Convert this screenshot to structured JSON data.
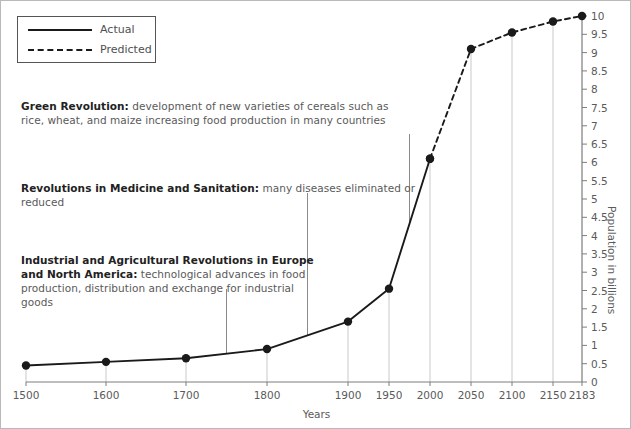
{
  "chart_data": {
    "type": "line",
    "title": "",
    "xlabel": "Years",
    "ylabel": "Population in billions",
    "ylim": [
      0,
      10
    ],
    "ytick_step": 0.5,
    "yticks": [
      "0",
      "0.5",
      "1",
      "1.5",
      "2",
      "2.5",
      "3",
      "3.5",
      "4",
      "4.5",
      "5",
      "5.5",
      "6",
      "6.5",
      "7",
      "7.5",
      "8",
      "8.5",
      "9",
      "9.5",
      "10"
    ],
    "xticks": [
      "1500",
      "1600",
      "1700",
      "1800",
      "1900",
      "1950",
      "2000",
      "2050",
      "2100",
      "2150",
      "2183"
    ],
    "grid": false,
    "legend_position": "top-left",
    "series": [
      {
        "name": "Actual",
        "style": "solid",
        "x": [
          1500,
          1600,
          1700,
          1800,
          1900,
          1950,
          2000
        ],
        "values": [
          0.45,
          0.55,
          0.65,
          0.9,
          1.65,
          2.55,
          6.1
        ]
      },
      {
        "name": "Predicted",
        "style": "dashed",
        "x": [
          2000,
          2050,
          2100,
          2150,
          2183
        ],
        "values": [
          6.1,
          9.1,
          9.55,
          9.85,
          10.0
        ]
      }
    ],
    "annotations": [
      {
        "bold": "Green Revolution:",
        "text": " development of new varieties of cereals such as rice, wheat, and maize increasing food production in many countries",
        "anchor_year": 1975
      },
      {
        "bold": "Revolutions in Medicine and Sanitation:",
        "text": " many diseases eliminated or reduced",
        "anchor_year": 1850
      },
      {
        "bold": "Industrial and Agricultural Revolutions in Europe and North America:",
        "text": " technological advances in food production, distribution and exchange for industrial goods",
        "anchor_year": 1750
      }
    ]
  },
  "legend": {
    "items": [
      {
        "label": "Actual",
        "style": "solid"
      },
      {
        "label": "Predicted",
        "style": "dashed"
      }
    ]
  },
  "colors": {
    "line": "#1a1a1a",
    "marker": "#1a1a1a",
    "axis": "#7d7d7d",
    "gridline": "#c9c9c9",
    "leader": "#8a8a8a",
    "text": "#5a5a5a",
    "bold_text": "#222222",
    "frame": "#b9b9b9"
  }
}
